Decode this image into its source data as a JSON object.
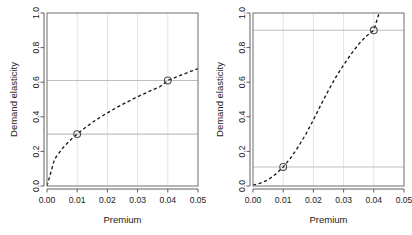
{
  "figure": {
    "background": "#ffffff",
    "panel_count": 2,
    "curve_color": "#1a1a1a",
    "grid_color": "#d9d9d9",
    "reference_line_color": "#bfbfbf",
    "box_color": "#6e6e6e",
    "marker_color": "#4d4d4d"
  },
  "chart_data": [
    {
      "type": "line",
      "title": "",
      "xlabel": "Premium",
      "ylabel": "Demand elasticity",
      "xlim": [
        0.0,
        0.05
      ],
      "ylim": [
        0.0,
        1.0
      ],
      "xticks": [
        0.0,
        0.01,
        0.02,
        0.03,
        0.04,
        0.05
      ],
      "xtick_labels": [
        "0.00",
        "0.01",
        "0.02",
        "0.03",
        "0.04",
        "0.05"
      ],
      "yticks": [
        0.0,
        0.2,
        0.4,
        0.6,
        0.8,
        1.0
      ],
      "ytick_labels": [
        "0.0",
        "0.2",
        "0.4",
        "0.6",
        "0.8",
        "1.0"
      ],
      "grid": true,
      "legend": "none",
      "linestyle": "dashed",
      "x": [
        0.0,
        0.0025,
        0.005,
        0.0075,
        0.01,
        0.0125,
        0.015,
        0.0175,
        0.02,
        0.0225,
        0.025,
        0.0275,
        0.03,
        0.0325,
        0.035,
        0.0375,
        0.04,
        0.0425,
        0.045,
        0.0475,
        0.05
      ],
      "y": [
        0.0,
        0.155,
        0.215,
        0.262,
        0.3,
        0.335,
        0.367,
        0.396,
        0.423,
        0.448,
        0.472,
        0.494,
        0.516,
        0.536,
        0.556,
        0.575,
        0.61,
        0.628,
        0.645,
        0.662,
        0.678
      ],
      "markers": [
        {
          "x": 0.01,
          "y": 0.3,
          "shape": "open-circle"
        },
        {
          "x": 0.04,
          "y": 0.61,
          "shape": "open-circle"
        }
      ],
      "reference_lines": [
        {
          "orientation": "horizontal",
          "y": 0.3
        },
        {
          "orientation": "horizontal",
          "y": 0.61
        }
      ]
    },
    {
      "type": "line",
      "title": "",
      "xlabel": "Premium",
      "ylabel": "Demand elasticity",
      "xlim": [
        0.0,
        0.05
      ],
      "ylim": [
        0.0,
        1.0
      ],
      "xticks": [
        0.0,
        0.01,
        0.02,
        0.03,
        0.04,
        0.05
      ],
      "xtick_labels": [
        "0.00",
        "0.01",
        "0.02",
        "0.03",
        "0.04",
        "0.05"
      ],
      "yticks": [
        0.0,
        0.2,
        0.4,
        0.6,
        0.8,
        1.0
      ],
      "ytick_labels": [
        "0.0",
        "0.2",
        "0.4",
        "0.6",
        "0.8",
        "1.0"
      ],
      "grid": true,
      "legend": "none",
      "linestyle": "dashed",
      "x": [
        0.0,
        0.0025,
        0.005,
        0.0075,
        0.01,
        0.0125,
        0.015,
        0.0175,
        0.02,
        0.0225,
        0.025,
        0.0275,
        0.03,
        0.0325,
        0.035,
        0.0375,
        0.04,
        0.0415,
        0.0425
      ],
      "y": [
        0.005,
        0.017,
        0.036,
        0.068,
        0.11,
        0.163,
        0.227,
        0.3,
        0.382,
        0.47,
        0.553,
        0.631,
        0.7,
        0.763,
        0.82,
        0.866,
        0.9,
        0.985,
        1.04
      ],
      "markers": [
        {
          "x": 0.01,
          "y": 0.11,
          "shape": "open-circle"
        },
        {
          "x": 0.04,
          "y": 0.9,
          "shape": "open-circle"
        }
      ],
      "reference_lines": [
        {
          "orientation": "horizontal",
          "y": 0.11
        },
        {
          "orientation": "horizontal",
          "y": 0.9
        }
      ]
    }
  ]
}
